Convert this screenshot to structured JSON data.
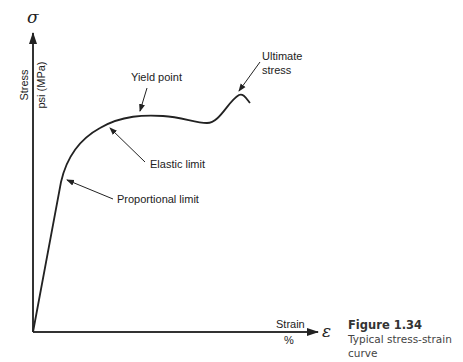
{
  "diagram": {
    "type": "stress-strain curve",
    "y_axis": {
      "symbol": "σ",
      "label": "Stress",
      "unit": "psi (MPa)"
    },
    "x_axis": {
      "symbol": "ε",
      "label": "Strain",
      "unit": "%"
    },
    "annotations": [
      {
        "id": "proportional-limit",
        "text": "Proportional limit"
      },
      {
        "id": "elastic-limit",
        "text": "Elastic limit"
      },
      {
        "id": "yield-point",
        "text": "Yield point"
      },
      {
        "id": "ultimate-stress",
        "text_line1": "Ultimate",
        "text_line2": "stress"
      }
    ],
    "colors": {
      "line": "#222222",
      "axis": "#333333"
    }
  },
  "caption": {
    "title": "Figure 1.34",
    "text": "Typical stress-strain curve"
  }
}
